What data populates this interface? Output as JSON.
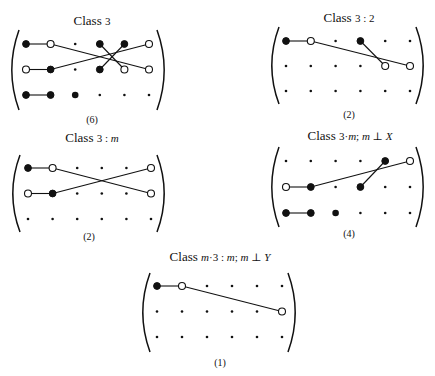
{
  "figure": {
    "panels": [
      {
        "id": "class-3",
        "title_prefix": "Class",
        "title_parts": [
          {
            "text": "3",
            "italic": false
          }
        ],
        "count_label": "(6)",
        "grid": {
          "rows": 3,
          "cols": 6
        },
        "points": [
          {
            "row": 0,
            "col": 0,
            "kind": "filled"
          },
          {
            "row": 0,
            "col": 1,
            "kind": "open"
          },
          {
            "row": 0,
            "col": 2,
            "kind": "small"
          },
          {
            "row": 0,
            "col": 3,
            "kind": "filled"
          },
          {
            "row": 0,
            "col": 4,
            "kind": "filled"
          },
          {
            "row": 0,
            "col": 5,
            "kind": "open"
          },
          {
            "row": 1,
            "col": 0,
            "kind": "open"
          },
          {
            "row": 1,
            "col": 1,
            "kind": "filled"
          },
          {
            "row": 1,
            "col": 2,
            "kind": "small"
          },
          {
            "row": 1,
            "col": 3,
            "kind": "filled"
          },
          {
            "row": 1,
            "col": 4,
            "kind": "open"
          },
          {
            "row": 1,
            "col": 5,
            "kind": "open"
          },
          {
            "row": 2,
            "col": 0,
            "kind": "filled"
          },
          {
            "row": 2,
            "col": 1,
            "kind": "filled"
          },
          {
            "row": 2,
            "col": 2,
            "kind": "big"
          },
          {
            "row": 2,
            "col": 3,
            "kind": "small"
          },
          {
            "row": 2,
            "col": 4,
            "kind": "small"
          },
          {
            "row": 2,
            "col": 5,
            "kind": "small"
          }
        ],
        "links": [
          [
            [
              0,
              0
            ],
            [
              0,
              1
            ]
          ],
          [
            [
              0,
              1
            ],
            [
              1,
              5
            ]
          ],
          [
            [
              1,
              0
            ],
            [
              1,
              1
            ]
          ],
          [
            [
              1,
              1
            ],
            [
              0,
              5
            ]
          ],
          [
            [
              0,
              3
            ],
            [
              1,
              4
            ]
          ],
          [
            [
              0,
              4
            ],
            [
              1,
              3
            ]
          ],
          [
            [
              2,
              0
            ],
            [
              2,
              1
            ]
          ]
        ]
      },
      {
        "id": "class-3-2",
        "title_prefix": "Class",
        "title_parts": [
          {
            "text": "3 : 2",
            "italic": false
          }
        ],
        "count_label": "(2)",
        "grid": {
          "rows": 3,
          "cols": 6
        },
        "points": [
          {
            "row": 0,
            "col": 0,
            "kind": "filled"
          },
          {
            "row": 0,
            "col": 1,
            "kind": "open"
          },
          {
            "row": 0,
            "col": 2,
            "kind": "small"
          },
          {
            "row": 0,
            "col": 3,
            "kind": "filled"
          },
          {
            "row": 0,
            "col": 4,
            "kind": "small"
          },
          {
            "row": 0,
            "col": 5,
            "kind": "small"
          },
          {
            "row": 1,
            "col": 0,
            "kind": "small"
          },
          {
            "row": 1,
            "col": 1,
            "kind": "small"
          },
          {
            "row": 1,
            "col": 2,
            "kind": "small"
          },
          {
            "row": 1,
            "col": 3,
            "kind": "small"
          },
          {
            "row": 1,
            "col": 4,
            "kind": "open"
          },
          {
            "row": 1,
            "col": 5,
            "kind": "open"
          },
          {
            "row": 2,
            "col": 0,
            "kind": "small"
          },
          {
            "row": 2,
            "col": 1,
            "kind": "small"
          },
          {
            "row": 2,
            "col": 2,
            "kind": "small"
          },
          {
            "row": 2,
            "col": 3,
            "kind": "small"
          },
          {
            "row": 2,
            "col": 4,
            "kind": "small"
          },
          {
            "row": 2,
            "col": 5,
            "kind": "small"
          }
        ],
        "links": [
          [
            [
              0,
              0
            ],
            [
              0,
              1
            ]
          ],
          [
            [
              0,
              1
            ],
            [
              1,
              5
            ]
          ],
          [
            [
              0,
              3
            ],
            [
              1,
              4
            ]
          ]
        ]
      },
      {
        "id": "class-3-m",
        "title_prefix": "Class",
        "title_parts": [
          {
            "text": "3 : ",
            "italic": false
          },
          {
            "text": "m",
            "italic": true
          }
        ],
        "count_label": "(2)",
        "grid": {
          "rows": 3,
          "cols": 6
        },
        "points": [
          {
            "row": 0,
            "col": 0,
            "kind": "filled"
          },
          {
            "row": 0,
            "col": 1,
            "kind": "open"
          },
          {
            "row": 0,
            "col": 2,
            "kind": "small"
          },
          {
            "row": 0,
            "col": 3,
            "kind": "small"
          },
          {
            "row": 0,
            "col": 4,
            "kind": "small"
          },
          {
            "row": 0,
            "col": 5,
            "kind": "open"
          },
          {
            "row": 1,
            "col": 0,
            "kind": "open"
          },
          {
            "row": 1,
            "col": 1,
            "kind": "filled"
          },
          {
            "row": 1,
            "col": 2,
            "kind": "small"
          },
          {
            "row": 1,
            "col": 3,
            "kind": "small"
          },
          {
            "row": 1,
            "col": 4,
            "kind": "small"
          },
          {
            "row": 1,
            "col": 5,
            "kind": "open"
          },
          {
            "row": 2,
            "col": 0,
            "kind": "small"
          },
          {
            "row": 2,
            "col": 1,
            "kind": "small"
          },
          {
            "row": 2,
            "col": 2,
            "kind": "small"
          },
          {
            "row": 2,
            "col": 3,
            "kind": "small"
          },
          {
            "row": 2,
            "col": 4,
            "kind": "small"
          },
          {
            "row": 2,
            "col": 5,
            "kind": "small"
          }
        ],
        "links": [
          [
            [
              0,
              0
            ],
            [
              0,
              1
            ]
          ],
          [
            [
              0,
              1
            ],
            [
              1,
              5
            ]
          ],
          [
            [
              1,
              0
            ],
            [
              1,
              1
            ]
          ],
          [
            [
              1,
              1
            ],
            [
              0,
              5
            ]
          ]
        ]
      },
      {
        "id": "class-3m-m-perp-x",
        "title_prefix": "Class",
        "title_parts": [
          {
            "text": "3·",
            "italic": false
          },
          {
            "text": "m",
            "italic": true
          },
          {
            "text": "; ",
            "italic": false
          },
          {
            "text": "m",
            "italic": true
          },
          {
            "text": " ⊥ ",
            "italic": false
          },
          {
            "text": "X",
            "italic": true
          }
        ],
        "count_label": "(4)",
        "grid": {
          "rows": 3,
          "cols": 6
        },
        "points": [
          {
            "row": 0,
            "col": 0,
            "kind": "small"
          },
          {
            "row": 0,
            "col": 1,
            "kind": "small"
          },
          {
            "row": 0,
            "col": 2,
            "kind": "small"
          },
          {
            "row": 0,
            "col": 3,
            "kind": "small"
          },
          {
            "row": 0,
            "col": 4,
            "kind": "filled"
          },
          {
            "row": 0,
            "col": 5,
            "kind": "open"
          },
          {
            "row": 1,
            "col": 0,
            "kind": "open"
          },
          {
            "row": 1,
            "col": 1,
            "kind": "filled"
          },
          {
            "row": 1,
            "col": 2,
            "kind": "small"
          },
          {
            "row": 1,
            "col": 3,
            "kind": "filled"
          },
          {
            "row": 1,
            "col": 4,
            "kind": "small"
          },
          {
            "row": 1,
            "col": 5,
            "kind": "small"
          },
          {
            "row": 2,
            "col": 0,
            "kind": "filled"
          },
          {
            "row": 2,
            "col": 1,
            "kind": "filled"
          },
          {
            "row": 2,
            "col": 2,
            "kind": "big"
          },
          {
            "row": 2,
            "col": 3,
            "kind": "small"
          },
          {
            "row": 2,
            "col": 4,
            "kind": "small"
          },
          {
            "row": 2,
            "col": 5,
            "kind": "small"
          }
        ],
        "links": [
          [
            [
              1,
              0
            ],
            [
              1,
              1
            ]
          ],
          [
            [
              1,
              1
            ],
            [
              0,
              5
            ]
          ],
          [
            [
              1,
              3
            ],
            [
              0,
              4
            ]
          ],
          [
            [
              2,
              0
            ],
            [
              2,
              1
            ]
          ]
        ]
      },
      {
        "id": "class-m3-m-perp-y",
        "title_prefix": "Class",
        "title_parts": [
          {
            "text": "m",
            "italic": true
          },
          {
            "text": "·3 : ",
            "italic": false
          },
          {
            "text": "m",
            "italic": true
          },
          {
            "text": "; ",
            "italic": false
          },
          {
            "text": "m",
            "italic": true
          },
          {
            "text": " ⊥ ",
            "italic": false
          },
          {
            "text": "Y",
            "italic": true
          }
        ],
        "count_label": "(1)",
        "grid": {
          "rows": 3,
          "cols": 6
        },
        "points": [
          {
            "row": 0,
            "col": 0,
            "kind": "filled"
          },
          {
            "row": 0,
            "col": 1,
            "kind": "open"
          },
          {
            "row": 0,
            "col": 2,
            "kind": "small"
          },
          {
            "row": 0,
            "col": 3,
            "kind": "small"
          },
          {
            "row": 0,
            "col": 4,
            "kind": "small"
          },
          {
            "row": 0,
            "col": 5,
            "kind": "small"
          },
          {
            "row": 1,
            "col": 0,
            "kind": "small"
          },
          {
            "row": 1,
            "col": 1,
            "kind": "small"
          },
          {
            "row": 1,
            "col": 2,
            "kind": "small"
          },
          {
            "row": 1,
            "col": 3,
            "kind": "small"
          },
          {
            "row": 1,
            "col": 4,
            "kind": "small"
          },
          {
            "row": 1,
            "col": 5,
            "kind": "open"
          },
          {
            "row": 2,
            "col": 0,
            "kind": "small"
          },
          {
            "row": 2,
            "col": 1,
            "kind": "small"
          },
          {
            "row": 2,
            "col": 2,
            "kind": "small"
          },
          {
            "row": 2,
            "col": 3,
            "kind": "small"
          },
          {
            "row": 2,
            "col": 4,
            "kind": "small"
          },
          {
            "row": 2,
            "col": 5,
            "kind": "small"
          }
        ],
        "links": [
          [
            [
              0,
              0
            ],
            [
              0,
              1
            ]
          ],
          [
            [
              0,
              1
            ],
            [
              1,
              5
            ]
          ]
        ]
      }
    ]
  }
}
